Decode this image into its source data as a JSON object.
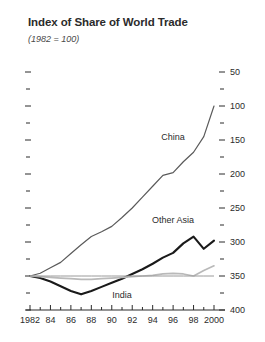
{
  "chart": {
    "title": "Index of Share of World Trade",
    "subtitle": "(1982 = 100)"
  },
  "labels": {
    "china": "China",
    "other_asia": "Other Asia",
    "india": "India"
  },
  "colors": {
    "china": "#5a5a5a",
    "other_asia": "#1a1a1a",
    "india": "#b9b9b9",
    "axis": "#2b2b2b",
    "reference": "#9a9a9a"
  },
  "y_ticks": [
    "400",
    "350",
    "300",
    "250",
    "200",
    "150",
    "100",
    "50"
  ],
  "x_ticks": [
    "1982",
    "84",
    "86",
    "88",
    "90",
    "92",
    "94",
    "96",
    "98",
    "2000"
  ],
  "chart_data": {
    "type": "line",
    "title": "Index of Share of World Trade",
    "subtitle": "(1982 = 100)",
    "xlabel": "",
    "ylabel": "",
    "xlim": [
      1982,
      2000
    ],
    "ylim": [
      50,
      400
    ],
    "grid": false,
    "legend": "inline-labels",
    "y_tick_values": [
      50,
      100,
      150,
      200,
      250,
      300,
      350,
      400
    ],
    "y_minor_ticks": [
      75,
      125,
      175,
      225,
      275,
      325,
      375
    ],
    "x_tick_labels": [
      "1982",
      "84",
      "86",
      "88",
      "90",
      "92",
      "94",
      "96",
      "98",
      "2000"
    ],
    "x": [
      1982,
      1983,
      1984,
      1985,
      1986,
      1987,
      1988,
      1989,
      1990,
      1991,
      1992,
      1993,
      1994,
      1995,
      1996,
      1997,
      1998,
      1999,
      2000
    ],
    "series": [
      {
        "name": "China",
        "color": "#5a5a5a",
        "values": [
          100,
          104,
          112,
          120,
          133,
          146,
          158,
          165,
          173,
          186,
          200,
          216,
          232,
          248,
          252,
          268,
          282,
          305,
          350
        ]
      },
      {
        "name": "Other Asia",
        "color": "#1a1a1a",
        "values": [
          100,
          97,
          92,
          85,
          78,
          73,
          78,
          84,
          90,
          96,
          103,
          110,
          118,
          127,
          134,
          148,
          158,
          140,
          152
        ]
      },
      {
        "name": "India",
        "color": "#b9b9b9",
        "values": [
          100,
          99,
          98,
          97,
          96,
          95,
          95,
          96,
          97,
          98,
          99,
          100,
          101,
          103,
          104,
          103,
          100,
          108,
          115
        ]
      },
      {
        "name": "reference-1982-baseline",
        "color": "#9a9a9a",
        "reference": true,
        "values": [
          100,
          100,
          100,
          100,
          100,
          100,
          100,
          100,
          100,
          100,
          100,
          100,
          100,
          100,
          100,
          100,
          100,
          100,
          100
        ]
      }
    ],
    "annotations": [
      {
        "text": "China",
        "x": 1996,
        "y": 300
      },
      {
        "text": "Other Asia",
        "x": 1996,
        "y": 178
      },
      {
        "text": "India",
        "x": 1991,
        "y": 68
      }
    ]
  }
}
